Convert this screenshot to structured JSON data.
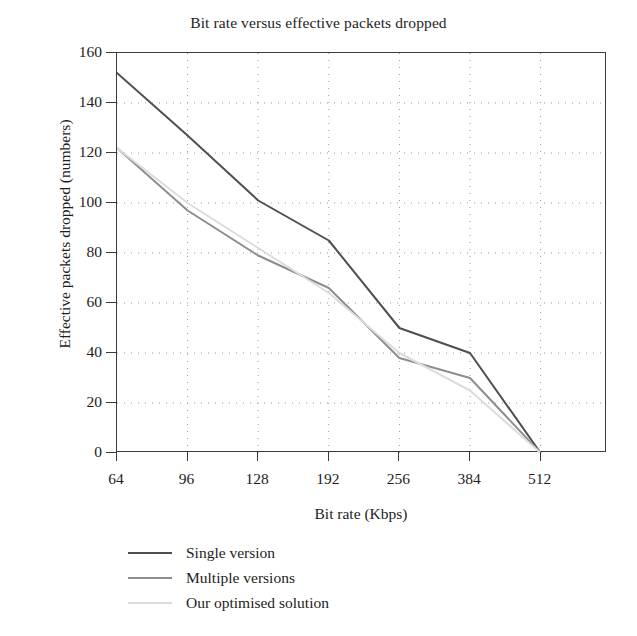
{
  "chart_data": {
    "type": "line",
    "title": "Bit rate versus effective packets dropped",
    "xlabel": "Bit rate (Kbps)",
    "ylabel": "Effective packets dropped (numbers)",
    "categories": [
      "64",
      "96",
      "128",
      "192",
      "256",
      "384",
      "512"
    ],
    "x": [
      64,
      96,
      128,
      192,
      256,
      384,
      512
    ],
    "ylim": [
      0,
      160
    ],
    "yticks": [
      0,
      20,
      40,
      60,
      80,
      100,
      120,
      140,
      160
    ],
    "grid": "dotted",
    "legend_position": "below-axes-left",
    "series": [
      {
        "name": "Single version",
        "color": "#4f4f4f",
        "values": [
          152,
          127,
          101,
          85,
          50,
          40,
          0
        ]
      },
      {
        "name": "Multiple versions",
        "color": "#8d8d8d",
        "values": [
          122,
          97,
          79,
          66,
          38,
          30,
          0
        ]
      },
      {
        "name": "Our optimised solution",
        "color": "#dcdcdc",
        "values": [
          122,
          100,
          82,
          64,
          40,
          25,
          0
        ]
      }
    ]
  },
  "axis": {
    "y_tick_labels": [
      "160",
      "140",
      "120",
      "100",
      "80",
      "60",
      "40",
      "20",
      "0"
    ],
    "x_tick_labels": [
      "64",
      "96",
      "128",
      "192",
      "256",
      "384",
      "512"
    ]
  },
  "legend": {
    "items": [
      {
        "label": "Single version",
        "color": "#4f4f4f"
      },
      {
        "label": "Multiple versions",
        "color": "#8d8d8d"
      },
      {
        "label": "Our optimised solution",
        "color": "#dcdcdc"
      }
    ]
  }
}
